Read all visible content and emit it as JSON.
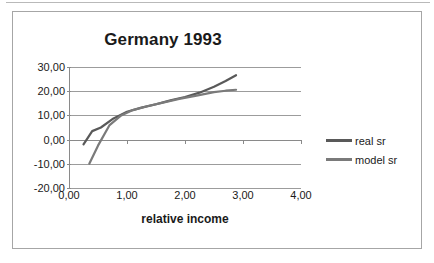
{
  "chart_data": {
    "type": "line",
    "title": "Germany 1993",
    "xlabel": "relative income",
    "ylabel": "",
    "xlim": [
      0,
      4
    ],
    "ylim": [
      -20,
      30
    ],
    "grid": true,
    "legend_position": "right",
    "x_ticks": [
      "0,00",
      "1,00",
      "2,00",
      "3,00",
      "4,00"
    ],
    "y_ticks": [
      "30,00",
      "20,00",
      "10,00",
      "0,00",
      "-10,00",
      "-20,00"
    ],
    "x_tick_values": [
      0,
      1,
      2,
      3,
      4
    ],
    "y_tick_values": [
      30,
      20,
      10,
      0,
      -10,
      -20
    ],
    "series": [
      {
        "name": "real sr",
        "color": "#595959",
        "x": [
          0.25,
          0.4,
          0.55,
          0.75,
          1.0,
          1.25,
          1.5,
          1.75,
          2.0,
          2.25,
          2.5,
          2.7,
          2.88
        ],
        "y": [
          -2.0,
          3.5,
          5.0,
          8.5,
          11.5,
          13.2,
          14.6,
          16.2,
          17.6,
          19.4,
          21.8,
          24.2,
          26.6
        ]
      },
      {
        "name": "model sr",
        "color": "#7a7a7a",
        "x": [
          0.35,
          0.5,
          0.7,
          0.9,
          1.1,
          1.35,
          1.6,
          1.9,
          2.2,
          2.5,
          2.7,
          2.88
        ],
        "y": [
          -10.0,
          -2.5,
          6.0,
          10.0,
          12.2,
          13.8,
          15.2,
          16.8,
          18.2,
          19.6,
          20.2,
          20.6
        ]
      }
    ]
  },
  "legend": {
    "items": [
      {
        "label": "real sr"
      },
      {
        "label": "model sr"
      }
    ]
  }
}
